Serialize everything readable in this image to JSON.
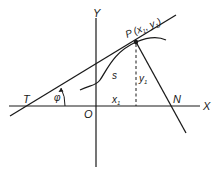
{
  "diagram": {
    "type": "tangent-normal-geometry",
    "axes": {
      "x_label": "X",
      "y_label": "Y",
      "origin_label": "O"
    },
    "point": {
      "label": "P",
      "coords_label_open": "(x",
      "coords_x_sub": "1",
      "coords_sep": ", y",
      "coords_y_sub": "1",
      "coords_close": ")"
    },
    "labels": {
      "tangent_intersect": "T",
      "normal_intersect": "N",
      "angle": "φ",
      "curve": "s",
      "x1_main": "x",
      "x1_sub": "1",
      "y1_main": "y",
      "y1_sub": "1"
    },
    "colors": {
      "line": "#1a1a1a",
      "background": "#ffffff"
    }
  }
}
